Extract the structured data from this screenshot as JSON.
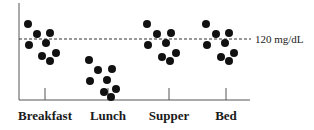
{
  "chart_data": {
    "type": "scatter",
    "title": "",
    "xlabel": "",
    "ylabel": "",
    "categories": [
      "Breakfast",
      "Lunch",
      "Supper",
      "Bed"
    ],
    "reference_line": {
      "label": "120 mg/dL",
      "style": "dashed",
      "position": "above middle of plot"
    },
    "grid": false,
    "legend": null,
    "series": [
      {
        "name": "Breakfast",
        "relation_to_reference": "clustered around and slightly below 120 mg/dL",
        "point_count": 8
      },
      {
        "name": "Lunch",
        "relation_to_reference": "well below 120 mg/dL",
        "point_count": 8
      },
      {
        "name": "Supper",
        "relation_to_reference": "clustered around and slightly below 120 mg/dL",
        "point_count": 8
      },
      {
        "name": "Bed",
        "relation_to_reference": "clustered around and slightly below 120 mg/dL",
        "point_count": 8
      }
    ],
    "points_px": {
      "Breakfast": [
        [
          28,
          24
        ],
        [
          37,
          34
        ],
        [
          50,
          33
        ],
        [
          29,
          45
        ],
        [
          46,
          43
        ],
        [
          42,
          56
        ],
        [
          56,
          53
        ],
        [
          50,
          61
        ]
      ],
      "Lunch": [
        [
          89,
          60
        ],
        [
          98,
          70
        ],
        [
          112,
          69
        ],
        [
          90,
          81
        ],
        [
          107,
          80
        ],
        [
          104,
          92
        ],
        [
          116,
          89
        ],
        [
          111,
          97
        ]
      ],
      "Supper": [
        [
          147,
          24
        ],
        [
          157,
          34
        ],
        [
          171,
          33
        ],
        [
          148,
          45
        ],
        [
          166,
          43
        ],
        [
          162,
          57
        ],
        [
          176,
          53
        ],
        [
          170,
          61
        ]
      ],
      "Bed": [
        [
          206,
          24
        ],
        [
          216,
          34
        ],
        [
          229,
          33
        ],
        [
          207,
          45
        ],
        [
          225,
          43
        ],
        [
          221,
          57
        ],
        [
          234,
          53
        ],
        [
          229,
          61
        ]
      ]
    }
  },
  "labels": {
    "reference": "120 mg/dL",
    "categories": [
      "Breakfast",
      "Lunch",
      "Supper",
      "Bed"
    ]
  }
}
